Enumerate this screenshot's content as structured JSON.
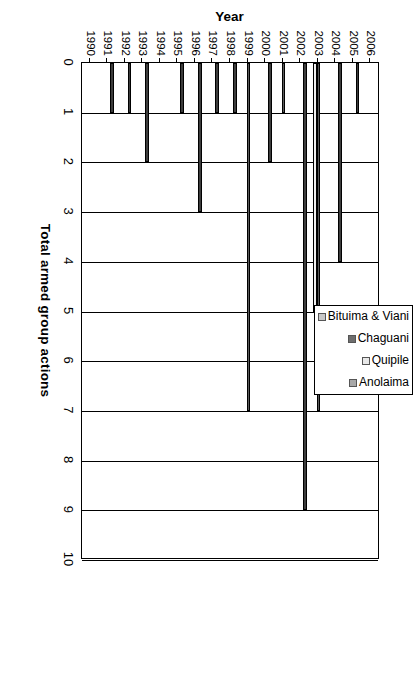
{
  "chart_data": {
    "type": "bar",
    "orientation": "vertical-rotated",
    "title": "",
    "xlabel": "Year",
    "ylabel": "Total armed group actions",
    "ylim": [
      0,
      10
    ],
    "ytick_labels": [
      "0",
      "1",
      "2",
      "3",
      "4",
      "5",
      "6",
      "7",
      "8",
      "9",
      "10"
    ],
    "ytick_values": [
      0,
      1,
      2,
      3,
      4,
      5,
      6,
      7,
      8,
      9,
      10
    ],
    "grid": true,
    "legend_position": "top-right",
    "categories": [
      "1990",
      "1991",
      "1992",
      "1993",
      "1994",
      "1995",
      "1996",
      "1997",
      "1998",
      "1999",
      "2000",
      "2001",
      "2002",
      "2003",
      "2004",
      "2005",
      "2006"
    ],
    "series": [
      {
        "name": "Bituima & Viani",
        "color": "#3c3c3c",
        "values": [
          0,
          1,
          1,
          2,
          0,
          1,
          3,
          1,
          1,
          0,
          2,
          0,
          9,
          0,
          4,
          1,
          0
        ]
      },
      {
        "name": "Chaguani",
        "color": "#5a5a5a",
        "values": [
          0,
          0,
          0,
          0,
          0,
          0,
          0,
          0,
          0,
          7,
          0,
          1,
          0,
          7,
          0,
          0,
          0
        ]
      },
      {
        "name": "Quipile",
        "color": "#f0f0f0",
        "values": [
          0,
          0,
          0,
          0,
          0,
          0,
          0,
          0,
          0,
          0,
          0,
          0,
          0,
          5,
          0,
          0,
          0
        ]
      },
      {
        "name": "Anolaima",
        "color": "#9a9a9a",
        "values": [
          0,
          0,
          0,
          0,
          0,
          0,
          0,
          0,
          0,
          0,
          0,
          0,
          0,
          0,
          0,
          0,
          0
        ]
      }
    ]
  },
  "legend": {
    "items": [
      {
        "label": "Bituima & Viani",
        "swatch": "#c8c8c8"
      },
      {
        "label": "Chaguani",
        "swatch": "#6e6e6e"
      },
      {
        "label": "Quipile",
        "swatch": "#e8e8e8"
      },
      {
        "label": "Anolaima",
        "swatch": "#a8a8a8"
      }
    ]
  },
  "axes": {
    "value_axis_title": "Total armed group actions",
    "category_axis_title": "Year"
  }
}
